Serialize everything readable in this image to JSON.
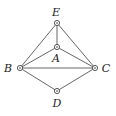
{
  "diagram": {
    "type": "graph",
    "nodes": [
      {
        "id": "E",
        "label": "E",
        "x": 57,
        "y": 23,
        "label_x": 56,
        "label_y": 16
      },
      {
        "id": "A",
        "label": "A",
        "x": 57,
        "y": 47,
        "label_x": 56,
        "label_y": 62
      },
      {
        "id": "B",
        "label": "B",
        "x": 20,
        "y": 68,
        "label_x": 8,
        "label_y": 72
      },
      {
        "id": "C",
        "label": "C",
        "x": 95,
        "y": 68,
        "label_x": 106,
        "label_y": 72
      },
      {
        "id": "D",
        "label": "D",
        "x": 57,
        "y": 91,
        "label_x": 57,
        "label_y": 107
      }
    ],
    "edges": [
      [
        "E",
        "B"
      ],
      [
        "E",
        "C"
      ],
      [
        "E",
        "A"
      ],
      [
        "A",
        "B"
      ],
      [
        "A",
        "C"
      ],
      [
        "B",
        "C"
      ],
      [
        "B",
        "D"
      ],
      [
        "D",
        "C"
      ]
    ],
    "colors": {
      "edge": "#555555",
      "node_stroke": "#444444",
      "label": "#222222"
    }
  }
}
